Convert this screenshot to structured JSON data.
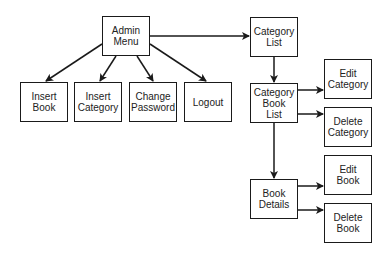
{
  "diagram": {
    "type": "flowchart",
    "colors": {
      "stroke": "#1a1a1a",
      "text": "#222222",
      "background": "#ffffff"
    },
    "nodes": [
      {
        "id": "admin_menu",
        "label": "Admin\nMenu",
        "x": 102,
        "y": 16,
        "w": 48,
        "h": 40
      },
      {
        "id": "insert_book",
        "label": "Insert\nBook",
        "x": 20,
        "y": 82,
        "w": 48,
        "h": 40
      },
      {
        "id": "insert_category",
        "label": "Insert\nCategory",
        "x": 74,
        "y": 82,
        "w": 48,
        "h": 40
      },
      {
        "id": "change_password",
        "label": "Change\nPassword",
        "x": 129,
        "y": 82,
        "w": 48,
        "h": 40
      },
      {
        "id": "logout",
        "label": "Logout",
        "x": 184,
        "y": 82,
        "w": 48,
        "h": 40
      },
      {
        "id": "category_list",
        "label": "Category\nList",
        "x": 250,
        "y": 17,
        "w": 48,
        "h": 40
      },
      {
        "id": "category_book_list",
        "label": "Category\nBook\nList",
        "x": 250,
        "y": 83,
        "w": 48,
        "h": 40
      },
      {
        "id": "edit_category",
        "label": "Edit\nCategory",
        "x": 324,
        "y": 59,
        "w": 48,
        "h": 40
      },
      {
        "id": "delete_category",
        "label": "Delete\nCategory",
        "x": 324,
        "y": 107,
        "w": 48,
        "h": 40
      },
      {
        "id": "book_details",
        "label": "Book\nDetails",
        "x": 250,
        "y": 179,
        "w": 48,
        "h": 40
      },
      {
        "id": "edit_book",
        "label": "Edit\nBook",
        "x": 324,
        "y": 155,
        "w": 48,
        "h": 40
      },
      {
        "id": "delete_book",
        "label": "Delete\nBook",
        "x": 324,
        "y": 203,
        "w": 48,
        "h": 40
      }
    ],
    "edges": [
      {
        "from": "admin_menu",
        "to": "insert_book",
        "path": [
          [
            102,
            44
          ],
          [
            46,
            81
          ]
        ]
      },
      {
        "from": "admin_menu",
        "to": "insert_category",
        "path": [
          [
            116,
            56
          ],
          [
            100,
            81
          ]
        ]
      },
      {
        "from": "admin_menu",
        "to": "change_password",
        "path": [
          [
            137,
            56
          ],
          [
            153,
            81
          ]
        ]
      },
      {
        "from": "admin_menu",
        "to": "logout",
        "path": [
          [
            150,
            44
          ],
          [
            206,
            81
          ]
        ]
      },
      {
        "from": "admin_menu",
        "to": "category_list",
        "path": [
          [
            150,
            36
          ],
          [
            249,
            36
          ]
        ]
      },
      {
        "from": "category_list",
        "to": "category_book_list",
        "path": [
          [
            274,
            57
          ],
          [
            274,
            82
          ]
        ]
      },
      {
        "from": "category_book_list",
        "to": "edit_category",
        "path": [
          [
            298,
            90
          ],
          [
            323,
            90
          ]
        ]
      },
      {
        "from": "category_book_list",
        "to": "delete_category",
        "path": [
          [
            298,
            114
          ],
          [
            323,
            114
          ]
        ]
      },
      {
        "from": "category_book_list",
        "to": "book_details",
        "path": [
          [
            274,
            123
          ],
          [
            274,
            178
          ]
        ]
      },
      {
        "from": "book_details",
        "to": "edit_book",
        "path": [
          [
            298,
            186
          ],
          [
            323,
            186
          ]
        ]
      },
      {
        "from": "book_details",
        "to": "delete_book",
        "path": [
          [
            298,
            210
          ],
          [
            323,
            210
          ]
        ]
      }
    ]
  }
}
